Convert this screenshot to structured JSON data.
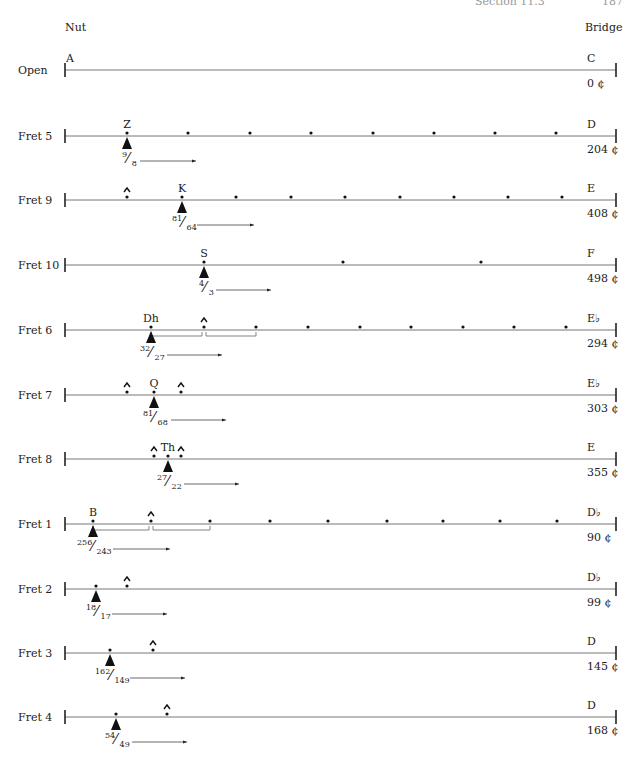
{
  "header": {
    "section": "Section 11.3",
    "page": "187"
  },
  "labels": {
    "nut": "Nut",
    "bridge": "Bridge"
  },
  "geometry": {
    "x_nut": 65,
    "x_bridge": 616
  },
  "rows": [
    {
      "label": "Open",
      "y": 70,
      "note": "C",
      "cents": "0 ¢",
      "top_label": "A",
      "top_label_x": 70,
      "dots": [],
      "carets": [],
      "triangle_x": null,
      "fraction": null,
      "brackets": []
    },
    {
      "label": "Fret 5",
      "y": 136,
      "note": "D",
      "cents": "204 ¢",
      "top_label": "Z",
      "top_label_x": 127,
      "dots": [
        127,
        188,
        250,
        311,
        373,
        434,
        495,
        556
      ],
      "carets": [],
      "triangle_x": 127,
      "fraction": {
        "num": "9",
        "den": "8",
        "x": 122,
        "arrow_from": 140,
        "arrow_to": 196
      },
      "brackets": []
    },
    {
      "label": "Fret 9",
      "y": 200,
      "note": "E",
      "cents": "408 ¢",
      "top_label": "K",
      "top_label_x": 182,
      "dots": [
        182,
        236,
        291,
        345,
        400,
        454,
        508,
        562
      ],
      "carets": [
        127
      ],
      "triangle_x": 182,
      "fraction": {
        "num": "81",
        "den": "64",
        "x": 172,
        "arrow_from": 197,
        "arrow_to": 254
      },
      "brackets": []
    },
    {
      "label": "Fret 10",
      "y": 265,
      "note": "F",
      "cents": "498 ¢",
      "top_label": "S",
      "top_label_x": 204,
      "dots": [
        204,
        343,
        481
      ],
      "carets": [],
      "triangle_x": 204,
      "fraction": {
        "num": "4",
        "den": "3",
        "x": 199,
        "arrow_from": 216,
        "arrow_to": 271
      },
      "brackets": []
    },
    {
      "label": "Fret 6",
      "y": 330,
      "note": "E♭",
      "cents": "294 ¢",
      "top_label": "Dh",
      "top_label_x": 151,
      "dots": [
        151,
        256,
        308,
        360,
        411,
        463,
        514,
        566
      ],
      "carets": [
        204
      ],
      "triangle_x": 151,
      "fraction": {
        "num": "32",
        "den": "27",
        "x": 140,
        "arrow_from": 167,
        "arrow_to": 222
      },
      "brackets": [
        [
          151,
          202
        ],
        [
          206,
          256
        ]
      ]
    },
    {
      "label": "Fret 7",
      "y": 395,
      "note": "E♭",
      "cents": "303 ¢",
      "top_label": "Q",
      "top_label_x": 154,
      "dots": [
        154
      ],
      "carets": [
        127,
        181
      ],
      "triangle_x": 154,
      "fraction": {
        "num": "81",
        "den": "68",
        "x": 143,
        "arrow_from": 171,
        "arrow_to": 226
      },
      "brackets": []
    },
    {
      "label": "Fret 8",
      "y": 459,
      "note": "E",
      "cents": "355 ¢",
      "top_label": "Th",
      "top_label_x": 168,
      "dots": [
        168
      ],
      "carets": [
        154,
        181
      ],
      "triangle_x": 168,
      "fraction": {
        "num": "27",
        "den": "22",
        "x": 157,
        "arrow_from": 184,
        "arrow_to": 239
      },
      "brackets": []
    },
    {
      "label": "Fret 1",
      "y": 524,
      "note": "D♭",
      "cents": "90 ¢",
      "top_label": "B",
      "top_label_x": 93,
      "dots": [
        93,
        210,
        270,
        328,
        387,
        443,
        500,
        557
      ],
      "carets": [
        151
      ],
      "triangle_x": 93,
      "fraction": {
        "num": "256",
        "den": "243",
        "x": 77,
        "arrow_from": 113,
        "arrow_to": 170
      },
      "brackets": [
        [
          93,
          149
        ],
        [
          153,
          210
        ]
      ]
    },
    {
      "label": "Fret 2",
      "y": 589,
      "note": "D♭",
      "cents": "99 ¢",
      "top_label": "",
      "top_label_x": null,
      "dots": [
        96
      ],
      "carets": [
        127
      ],
      "triangle_x": 96,
      "fraction": {
        "num": "18",
        "den": "17",
        "x": 86,
        "arrow_from": 112,
        "arrow_to": 167
      },
      "brackets": []
    },
    {
      "label": "Fret 3",
      "y": 653,
      "note": "D",
      "cents": "145 ¢",
      "top_label": "",
      "top_label_x": null,
      "dots": [
        110
      ],
      "carets": [
        153
      ],
      "triangle_x": 110,
      "fraction": {
        "num": "162",
        "den": "149",
        "x": 95,
        "arrow_from": 130,
        "arrow_to": 185
      },
      "brackets": []
    },
    {
      "label": "Fret 4",
      "y": 717,
      "note": "D",
      "cents": "168 ¢",
      "top_label": "",
      "top_label_x": null,
      "dots": [
        116
      ],
      "carets": [
        167
      ],
      "triangle_x": 116,
      "fraction": {
        "num": "54",
        "den": "49",
        "x": 105,
        "arrow_from": 132,
        "arrow_to": 187
      },
      "brackets": []
    }
  ],
  "accidentals": {
    "Fret 6": "flat",
    "Fret 7": "flat",
    "Fret 8": "half-flat",
    "Fret 1": "flat",
    "Fret 2": "flat",
    "Fret 3": "half-flat",
    "Fret 4": "natural",
    "Open": "natural",
    "Fret 5": "natural",
    "Fret 9": "natural",
    "Fret 10": "natural"
  }
}
